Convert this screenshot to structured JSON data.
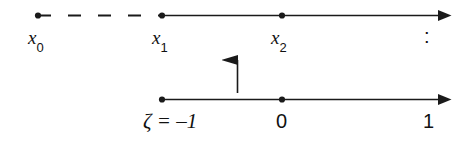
{
  "figure": {
    "background_color": "#ffffff",
    "stroke_color": "#1a1a1a",
    "width": 471,
    "height": 144
  },
  "top_axis": {
    "name": "x-axis",
    "y": 15,
    "x_start": 38,
    "x_end": 452,
    "dashed_from": 38,
    "dashed_to": 162,
    "arrow_at_right": true,
    "points": [
      {
        "id": "x0",
        "x": 38,
        "label_main": "x",
        "label_sub": "0"
      },
      {
        "id": "x1",
        "x": 162,
        "label_main": "x",
        "label_sub": "1"
      },
      {
        "id": "x2",
        "x": 282,
        "label_main": "x",
        "label_sub": "2"
      }
    ],
    "trailing_label": ":"
  },
  "bottom_axis": {
    "name": "zeta-axis",
    "y": 99,
    "x_start": 162,
    "x_end": 452,
    "arrow_at_right": true,
    "points": [
      {
        "id": "zeta-minus-one",
        "x": 162,
        "label": "ζ = –1"
      },
      {
        "id": "zero",
        "x": 282,
        "label": "0"
      },
      {
        "id": "one",
        "x": 440,
        "label": "1"
      }
    ]
  },
  "map_arrow": {
    "name": "upward-mapping-arrow",
    "x": 237,
    "y_tail": 93,
    "y_head": 44,
    "direction": "up"
  },
  "labels": {
    "x0_main": "x",
    "x0_sub": "0",
    "x1_main": "x",
    "x1_sub": "1",
    "x2_main": "x",
    "x2_sub": "2",
    "ellipsis_colon": ":",
    "zeta_equals_minus_one": "ζ = –1",
    "zero": "0",
    "one": "1"
  }
}
